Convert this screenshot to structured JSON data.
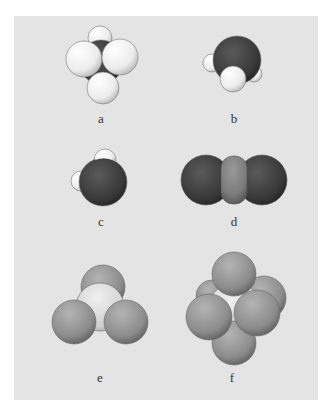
{
  "figure": {
    "background": "#e4e4e4",
    "molecules": [
      {
        "id": "a",
        "label": "a",
        "description": "tetrahedral, dark central atom with white atoms"
      },
      {
        "id": "b",
        "label": "b",
        "description": "large dark atom with small white atoms"
      },
      {
        "id": "c",
        "label": "c",
        "description": "large dark atom with two white atoms"
      },
      {
        "id": "d",
        "label": "d",
        "description": "linear: dark - gray - dark"
      },
      {
        "id": "e",
        "label": "e",
        "description": "trigonal pyramidal: light center with gray atoms"
      },
      {
        "id": "f",
        "label": "f",
        "description": "octahedral: white center with six gray atoms"
      }
    ],
    "colors": {
      "dark_atom": "#3a3a3a",
      "white_atom": "#f2f2f2",
      "gray_atom": "#8a8a8a",
      "mid_gray_atom": "#7a7a7a",
      "light_center": "#d8d8d8"
    }
  }
}
